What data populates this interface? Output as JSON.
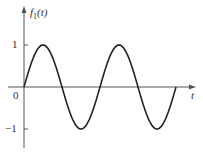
{
  "chart_data": {
    "type": "line",
    "title": "",
    "ylabel": "f1(t)",
    "ylabel_main": "f",
    "ylabel_sub": "1",
    "ylabel_arg": "(t)",
    "xlabel": "t",
    "yticks": [
      "1",
      "0",
      "−1"
    ],
    "ylim": [
      -1,
      1
    ],
    "grid": false,
    "series": [
      {
        "name": "f1(t)",
        "function": "sin",
        "periods": 2,
        "color": "#222222"
      }
    ]
  }
}
